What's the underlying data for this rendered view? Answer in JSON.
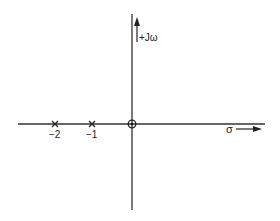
{
  "diagram": {
    "type": "s-plane pole-zero plot",
    "axes": {
      "imaginary_label": "+Jω",
      "real_label": "σ"
    },
    "poles": [
      {
        "value": -2,
        "label": "−2",
        "marker": "x"
      },
      {
        "value": -1,
        "label": "−1",
        "marker": "x"
      }
    ],
    "zeros": [
      {
        "value": 0,
        "label": "",
        "marker": "circle"
      }
    ],
    "colors": {
      "line": "#333333",
      "background": "#ffffff"
    }
  }
}
